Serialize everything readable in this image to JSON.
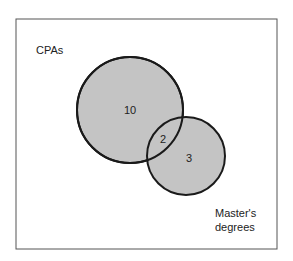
{
  "diagram": {
    "type": "venn",
    "sets": [
      {
        "label": "CPAs",
        "only_count": "10"
      },
      {
        "label_line1": "Master's",
        "label_line2": "degrees",
        "only_count": "3"
      }
    ],
    "intersection_count": "2",
    "colors": {
      "fill": "#c4c4c4",
      "stroke": "#1a1a1a",
      "frame": "#444444"
    }
  }
}
